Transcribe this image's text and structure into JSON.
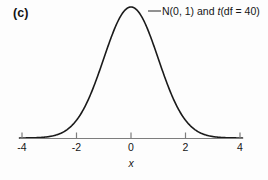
{
  "figure": {
    "panel_label": "(c)",
    "axis_title_x": "x",
    "series_label_parts": {
      "lead": "N(0, 1) and ",
      "italic": "t",
      "tail": "(df = 40)"
    },
    "series_label_full": "N(0, 1) and t(df = 40)",
    "colors": {
      "curve": "#1a1a1a",
      "axis": "#7d7d7d",
      "text": "#161616",
      "background": "#fdfdfd",
      "leader": "#3a3a3a"
    }
  },
  "chart_data": {
    "type": "line",
    "title": "",
    "subtitle": "",
    "xlabel": "x",
    "ylabel": "",
    "grid": false,
    "legend_position": "inline-annotation",
    "annotations": [
      {
        "text": "N(0, 1) and t(df = 40)",
        "points_to_x": 0.35,
        "leader_line": true
      }
    ],
    "xlim": [
      -4.4,
      4.4
    ],
    "ylim": [
      0,
      0.42
    ],
    "xticks": [
      -4,
      -2,
      0,
      2,
      4
    ],
    "xtick_labels": [
      "-4",
      "-2",
      "0",
      "2",
      "4"
    ],
    "yticks": [],
    "ytick_labels": [],
    "series": [
      {
        "name": "N(0, 1) and t(df = 40)",
        "distribution": "standard normal density, overlaid with t(df = 40) (visually indistinguishable)",
        "mean": 0,
        "sd": 1,
        "df": 40,
        "x": [
          -4.0,
          -3.75,
          -3.5,
          -3.25,
          -3.0,
          -2.75,
          -2.5,
          -2.25,
          -2.0,
          -1.75,
          -1.5,
          -1.25,
          -1.0,
          -0.75,
          -0.5,
          -0.25,
          0.0,
          0.25,
          0.5,
          0.75,
          1.0,
          1.25,
          1.5,
          1.75,
          2.0,
          2.25,
          2.5,
          2.75,
          3.0,
          3.25,
          3.5,
          3.75,
          4.0
        ],
        "values": [
          0.0001,
          0.0004,
          0.0009,
          0.002,
          0.0044,
          0.0091,
          0.0175,
          0.0317,
          0.054,
          0.0863,
          0.1295,
          0.1826,
          0.242,
          0.3011,
          0.3521,
          0.3867,
          0.3989,
          0.3867,
          0.3521,
          0.3011,
          0.242,
          0.1826,
          0.1295,
          0.0863,
          0.054,
          0.0317,
          0.0175,
          0.0091,
          0.0044,
          0.002,
          0.0009,
          0.0004,
          0.0001
        ]
      }
    ]
  }
}
